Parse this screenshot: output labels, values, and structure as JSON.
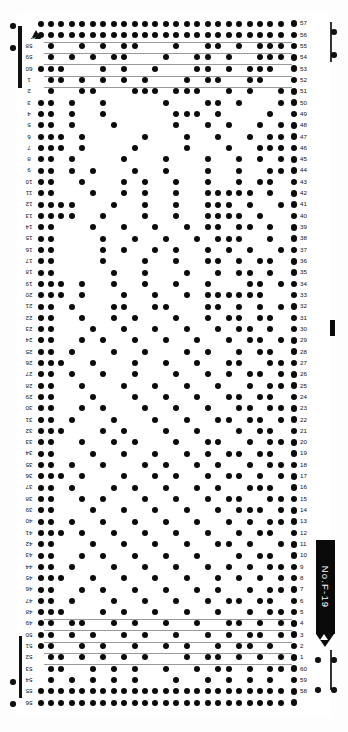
{
  "card": {
    "title": "Knitting Machine Punch Card",
    "pattern_label": "No. F - 19",
    "label_text": "No.F-19",
    "marker_letter": "A",
    "columns": 24,
    "rows": 60,
    "row_numbers_right": [
      57,
      56,
      55,
      54,
      53,
      52,
      51,
      50,
      49,
      48,
      47,
      46,
      45,
      44,
      43,
      42,
      41,
      40,
      39,
      38,
      37,
      36,
      35,
      34,
      33,
      32,
      31,
      30,
      29,
      28,
      27,
      26,
      25,
      24,
      23,
      22,
      21,
      20,
      19,
      18,
      17,
      16,
      15,
      14,
      13,
      12,
      11,
      10,
      9,
      8,
      7,
      6,
      5,
      4,
      3,
      2,
      1,
      60,
      59,
      58
    ],
    "row_numbers_left": [
      "",
      "",
      "58",
      "59",
      "60",
      "1",
      "2",
      "3",
      "4",
      "5",
      "6",
      "7",
      "8",
      "9",
      "10",
      "11",
      "12",
      "13",
      "14",
      "15",
      "16",
      "17",
      "18",
      "19",
      "20",
      "21",
      "22",
      "23",
      "24",
      "25",
      "26",
      "27",
      "28",
      "29",
      "30",
      "31",
      "32",
      "33",
      "34",
      "35",
      "36",
      "37",
      "38",
      "39",
      "40",
      "41",
      "42",
      "43",
      "44",
      "45",
      "46",
      "47",
      "48",
      "49",
      "50",
      "51",
      "52",
      "53",
      "54",
      "55",
      "56",
      "57"
    ],
    "colors": {
      "dot": "#0b0b0b",
      "paper": "#ffffff",
      "tag_background": "#0a0a0a",
      "tag_text": "#ffffff",
      "guide_line": "#9a9a9a"
    },
    "icons": {
      "top_marker": "triangle-marker-icon",
      "tag_arrow": "arrow-down-icon",
      "mid_tick": "registration-tick-icon"
    }
  },
  "punch_rows": [
    "111111111111111111111111",
    "111111111111111111111111",
    "010010101100010011010111",
    "010101011000100110100111",
    "111000101001000110101110",
    "011010101010001011001100",
    "010011000111011100101001",
    "110100100000100011010001",
    "110100100000011101000010",
    "110100010000010010100101",
    "111010000010001001001011",
    "111010000100001000100111",
    "110100001000100010010101",
    "110101000100100010010011",
    "110010001010010010010110",
    "110001001010010011111010",
    "111100010010010011101001",
    "111100100010010011110100",
    "110001001001001011011010",
    "110000100100100101110010",
    "110000101001010010101001",
    "110000100010010011010110",
    "110000010010001001011010",
    "111010010010010010001101",
    "111010001001001011111100",
    "110100011001100011010101",
    "110010010100010010110110",
    "110001001001001001011010",
    "110010100100100100101101",
    "110100010010001010010110",
    "111001000100100100110011",
    "110100100100010010101101",
    "110010001001001001001011",
    "110001000100100100110110",
    "110010100010010010011011",
    "110100010001001001101101",
    "111000101000100100010110",
    "110010010100010011001011",
    "110001001001001010110110",
    "110100100010100101001011",
    "111010001001010010110101",
    "110100010100100101001110",
    "110010100010010010110011",
    "110001001001001001011101",
    "110100100100100100101011",
    "111010010010010010010110",
    "110001001001001001101001",
    "110010100100100100010110",
    "110100010010010010101011",
    "111001001001001001010101",
    "110010100100100101001011",
    "110100010010010010110110",
    "111000101001001001001011",
    "110110010100100100110101",
    "110101001010010010101101",
    "110010100100101001011010",
    "011010101010001011010101",
    "011001010100100101101011",
    "010101010100010010101010",
    "111111111111111111111111",
    "111111111111111111111111"
  ]
}
